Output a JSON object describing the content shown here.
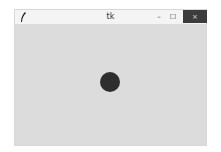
{
  "window": {
    "title": "tk",
    "buttons": {
      "minimize": "–",
      "maximize": "☐",
      "close": "×"
    }
  },
  "canvas": {
    "background": "#dcdcdc",
    "shapes": [
      {
        "type": "oval",
        "cx": 110,
        "cy": 82,
        "diameter": 20,
        "fill": "#2e2e2e"
      }
    ]
  }
}
